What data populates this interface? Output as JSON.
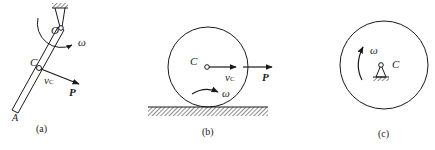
{
  "figures": [
    {
      "id": "a",
      "caption": "(a)",
      "description": "Rod OA pivoted at fixed support O, rotating with angular velocity omega; point C on rod with velocity v_C and force P",
      "labels": {
        "pivot": "O",
        "center": "C",
        "end": "A",
        "omega": "ω",
        "velocity": "v",
        "velocity_sub": "C",
        "force": "P"
      }
    },
    {
      "id": "b",
      "caption": "(b)",
      "description": "Disk rolling on hatched ground, center C with velocity v_C and force P, angular velocity omega",
      "labels": {
        "center": "C",
        "omega": "ω",
        "velocity": "v",
        "velocity_sub": "C",
        "force": "P"
      }
    },
    {
      "id": "c",
      "caption": "(c)",
      "description": "Disk rotating about fixed pivot at center C with angular velocity omega",
      "labels": {
        "center": "C",
        "omega": "ω"
      }
    }
  ],
  "colors": {
    "ink": "#1a1a1a",
    "background": "#ffffff"
  }
}
